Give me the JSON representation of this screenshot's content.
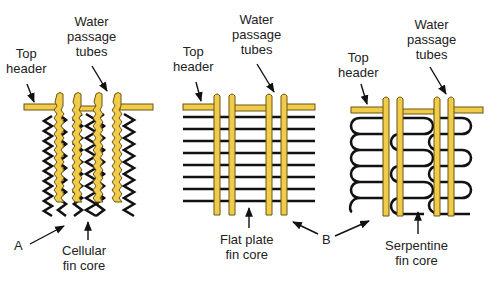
{
  "panels": [
    {
      "id": "cellular",
      "top_header_label": [
        "Top",
        "header"
      ],
      "tubes_label": [
        "Water",
        "passage",
        "tubes"
      ],
      "core_label": [
        "Cellular",
        "fin core"
      ],
      "letter": "A"
    },
    {
      "id": "flat-plate",
      "top_header_label": [
        "Top",
        "header"
      ],
      "tubes_label": [
        "Water",
        "passage",
        "tubes"
      ],
      "core_label": [
        "Flat plate",
        "fin core"
      ],
      "letter": "B"
    },
    {
      "id": "serpentine",
      "top_header_label": [
        "Top",
        "header"
      ],
      "tubes_label": [
        "Water",
        "passage",
        "tubes"
      ],
      "core_label": [
        "Serpentine",
        "fin core"
      ]
    }
  ],
  "colors": {
    "tube": "#f1cc4a",
    "tube_outline": "#6b5410",
    "fin": "#111111",
    "background": "#ffffff"
  }
}
